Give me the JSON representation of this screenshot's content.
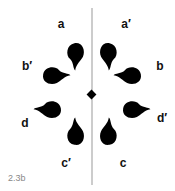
{
  "labels": {
    "a": "a",
    "a_prime": "a′",
    "b": "b",
    "b_prime": "b′",
    "c": "c",
    "c_prime": "c′",
    "d": "d",
    "d_prime": "d′"
  },
  "figure_number": "2.3b",
  "colors": {
    "shape": "#000000",
    "axis": "#999999"
  }
}
